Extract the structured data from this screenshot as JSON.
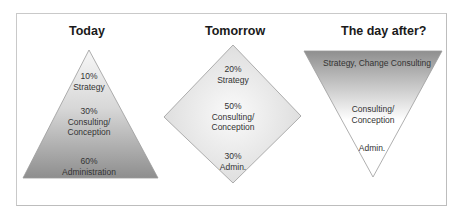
{
  "panels": [
    {
      "title": "Today",
      "shape": "pyramid",
      "labels": [
        {
          "pct": "10%",
          "text": "Strategy"
        },
        {
          "pct": "30%",
          "text": "Consulting/",
          "text2": "Conception"
        },
        {
          "pct": "60%",
          "text": "Administration"
        }
      ]
    },
    {
      "title": "Tomorrow",
      "shape": "diamond",
      "labels": [
        {
          "pct": "20%",
          "text": "Strategy"
        },
        {
          "pct": "50%",
          "text": "Consulting/",
          "text2": "Conception"
        },
        {
          "pct": "30%",
          "text": "Admin."
        }
      ]
    },
    {
      "title": "The day after?",
      "shape": "inverted-pyramid",
      "labels": [
        {
          "text": "Strategy, Change Consulting"
        },
        {
          "text": "Consulting/",
          "text2": "Conception"
        },
        {
          "text": "Admin."
        }
      ]
    }
  ],
  "colors": {
    "shape_dark": "#8f8f8f",
    "shape_light": "#f2f2f2",
    "outline": "#9a9a9a"
  }
}
